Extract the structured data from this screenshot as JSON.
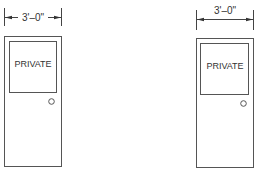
{
  "drawing": {
    "doors": [
      {
        "id": "left",
        "dimension_label": "3'–0\"",
        "window_label": "PRIVATE",
        "dimension_style": "text-inline"
      },
      {
        "id": "right",
        "dimension_label": "3'–0\"",
        "window_label": "PRIVATE",
        "dimension_style": "text-above"
      }
    ],
    "colors": {
      "line": "#555555",
      "text": "#333333",
      "background": "#ffffff"
    }
  }
}
